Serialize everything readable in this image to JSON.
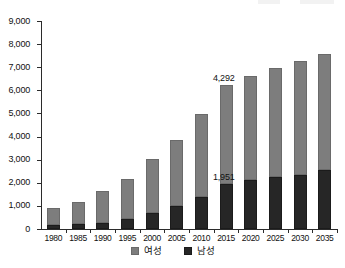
{
  "chart_data": {
    "type": "bar",
    "stacked": true,
    "title": "",
    "subtitle": "",
    "xlabel": "",
    "ylabel": "",
    "categories": [
      "1980",
      "1985",
      "1990",
      "1995",
      "2000",
      "2005",
      "2010",
      "2015",
      "2020",
      "2025",
      "2030",
      "2035"
    ],
    "series": [
      {
        "name": "남성",
        "color": "#262626",
        "values": [
          180,
          210,
          270,
          440,
          700,
          1010,
          1390,
          1951,
          2130,
          2230,
          2350,
          2550
        ]
      },
      {
        "name": "여성",
        "color": "#7d7d7d",
        "values": [
          720,
          970,
          1360,
          1730,
          2330,
          2820,
          3590,
          4292,
          4510,
          4730,
          4910,
          5020
        ]
      }
    ],
    "totals": [
      900,
      1180,
      1630,
      2170,
      3030,
      3830,
      4980,
      6243,
      6640,
      6960,
      7260,
      7570
    ],
    "ylim": [
      0,
      9000
    ],
    "ytick_values": [
      0,
      1000,
      2000,
      3000,
      4000,
      5000,
      6000,
      7000,
      8000,
      9000
    ],
    "ytick_labels": [
      "0",
      "1,000",
      "2,000",
      "3,000",
      "4,000",
      "5,000",
      "6,000",
      "7,000",
      "8,000",
      "9,000"
    ],
    "grid": false,
    "legend_position": "bottom",
    "annotations": [
      {
        "text": "4,292",
        "category": "2015",
        "series": "여성",
        "placement": "above-bar"
      },
      {
        "text": "1,951",
        "category": "2015",
        "series": "남성",
        "placement": "above-segment"
      }
    ]
  },
  "legend": {
    "items": [
      {
        "label": "여성",
        "swatch": "female-swatch"
      },
      {
        "label": "남성",
        "swatch": "male-swatch"
      }
    ]
  }
}
